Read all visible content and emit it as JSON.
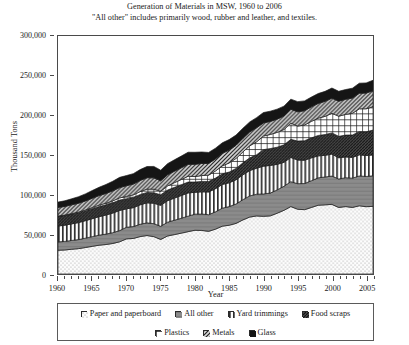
{
  "title": {
    "line1": "Generation of Materials in MSW, 1960 to 2006",
    "line2": "\"All other\" includes primarily wood, rubber and leather, and textiles."
  },
  "axes": {
    "ylabel": "Thousand Tons",
    "xlabel": "Year",
    "yticks": [
      "0",
      "50,000",
      "100,000",
      "150,000",
      "200,000",
      "250,000",
      "300,000"
    ],
    "xticks": [
      "1960",
      "1965",
      "1970",
      "1975",
      "1980",
      "1985",
      "1990",
      "1995",
      "2000",
      "2005"
    ]
  },
  "legend": {
    "row1": [
      {
        "label": "Paper and paperboard",
        "swatch": "dots-light"
      },
      {
        "label": "All other",
        "swatch": "gray-solid"
      },
      {
        "label": "Yard trimmings",
        "swatch": "vertical-stripes"
      },
      {
        "label": "Food scraps",
        "swatch": "dark-diagonal"
      }
    ],
    "row2": [
      {
        "label": "Plastics",
        "swatch": "crosshatch"
      },
      {
        "label": "Metals",
        "swatch": "diagonal"
      },
      {
        "label": "Glass",
        "swatch": "black-solid"
      }
    ]
  },
  "chart_data": {
    "type": "area",
    "title": "Generation of Materials in MSW, 1960 to 2006",
    "subtitle": "\"All other\" includes primarily wood, rubber and leather, and textiles.",
    "xlabel": "Year",
    "ylabel": "Thousand Tons",
    "xlim": [
      1960,
      2006
    ],
    "ylim": [
      0,
      300000
    ],
    "grid": false,
    "stacked": true,
    "legend_position": "bottom",
    "x": [
      1960,
      1961,
      1962,
      1963,
      1964,
      1965,
      1966,
      1967,
      1968,
      1969,
      1970,
      1971,
      1972,
      1973,
      1974,
      1975,
      1976,
      1977,
      1978,
      1979,
      1980,
      1981,
      1982,
      1983,
      1984,
      1985,
      1986,
      1987,
      1988,
      1989,
      1990,
      1991,
      1992,
      1993,
      1994,
      1995,
      1996,
      1997,
      1998,
      1999,
      2000,
      2001,
      2002,
      2003,
      2004,
      2005,
      2006
    ],
    "series": [
      {
        "name": "Paper and paperboard",
        "swatch": "dots-light",
        "values": [
          29990,
          30300,
          31200,
          32000,
          33400,
          34900,
          36300,
          37200,
          38500,
          40600,
          44310,
          44800,
          47200,
          48500,
          47100,
          43560,
          47900,
          49700,
          51500,
          53400,
          55160,
          54900,
          53800,
          56600,
          60300,
          61500,
          63800,
          68200,
          71800,
          73200,
          72730,
          73300,
          76600,
          80300,
          85000,
          81670,
          81100,
          83900,
          86700,
          87200,
          87740,
          83900,
          85000,
          83900,
          86000,
          84840,
          85300
        ],
        "units": "thousand tons"
      },
      {
        "name": "All other",
        "swatch": "gray-solid",
        "values": [
          10510,
          10800,
          11100,
          11400,
          11800,
          12200,
          12700,
          13100,
          13600,
          14100,
          14630,
          15000,
          15500,
          16000,
          16300,
          16600,
          17400,
          18100,
          18800,
          19500,
          20300,
          20700,
          21000,
          21800,
          22700,
          23500,
          24400,
          25500,
          26600,
          27400,
          28190,
          28700,
          29400,
          30300,
          31400,
          32200,
          32900,
          33700,
          34500,
          35100,
          35700,
          35900,
          36400,
          36900,
          37600,
          38100,
          38500
        ],
        "units": "thousand tons"
      },
      {
        "name": "Yard trimmings",
        "swatch": "vertical-stripes",
        "values": [
          20000,
          20400,
          20900,
          21400,
          22000,
          22600,
          23300,
          24000,
          24700,
          25400,
          23200,
          23800,
          24500,
          25200,
          25800,
          26400,
          27100,
          27900,
          28600,
          29300,
          27500,
          28000,
          28600,
          29200,
          29900,
          30000,
          30600,
          31300,
          32000,
          32700,
          35000,
          34900,
          32200,
          30200,
          30500,
          29800,
          29400,
          28800,
          27700,
          27300,
          27700,
          26700,
          26200,
          26200,
          26600,
          26400,
          26300
        ],
        "units": "thousand tons"
      },
      {
        "name": "Food scraps",
        "swatch": "dark-diagonal",
        "values": [
          12200,
          12300,
          12400,
          12500,
          12600,
          12700,
          12800,
          12900,
          13000,
          13100,
          12800,
          12900,
          13000,
          13100,
          13200,
          13300,
          13400,
          13500,
          13600,
          13700,
          13000,
          13100,
          13200,
          13300,
          13400,
          13500,
          14300,
          15100,
          16000,
          17000,
          20800,
          21200,
          21600,
          22000,
          22800,
          23900,
          24600,
          25200,
          25700,
          26200,
          26700,
          27000,
          27500,
          28300,
          29200,
          29900,
          31300
        ],
        "units": "thousand tons"
      },
      {
        "name": "Plastics",
        "swatch": "crosshatch",
        "values": [
          390,
          480,
          590,
          720,
          880,
          1400,
          1700,
          2000,
          2400,
          2700,
          2900,
          3200,
          3700,
          4200,
          4500,
          4500,
          5200,
          5900,
          6600,
          7300,
          6830,
          7400,
          8000,
          9000,
          10000,
          11500,
          12600,
          13800,
          15200,
          16300,
          17130,
          17800,
          18700,
          19300,
          20400,
          18940,
          19800,
          20800,
          21800,
          22900,
          24700,
          25400,
          26100,
          27300,
          28800,
          29000,
          29500
        ],
        "units": "thousand tons"
      },
      {
        "name": "Metals",
        "swatch": "diagonal",
        "values": [
          10820,
          10900,
          11000,
          11200,
          11400,
          11700,
          12000,
          12300,
          12600,
          13000,
          13490,
          13600,
          14000,
          14400,
          14300,
          13100,
          14100,
          14400,
          14700,
          15000,
          15510,
          15200,
          14800,
          15200,
          15800,
          16200,
          16500,
          17000,
          17500,
          17800,
          16550,
          16400,
          16700,
          17000,
          17500,
          17900,
          18000,
          18300,
          18600,
          18900,
          19100,
          18900,
          19000,
          19200,
          19600,
          19800,
          20100
        ],
        "units": "thousand tons"
      },
      {
        "name": "Glass",
        "swatch": "black-solid",
        "values": [
          6720,
          7100,
          7600,
          8200,
          8900,
          9700,
          10500,
          11300,
          12100,
          12900,
          12740,
          13200,
          13700,
          14100,
          14400,
          13400,
          14000,
          14400,
          14800,
          15300,
          15130,
          14500,
          13800,
          13500,
          13300,
          13200,
          12900,
          12800,
          12600,
          12700,
          13100,
          12900,
          12600,
          12500,
          12800,
          12840,
          12400,
          12300,
          12500,
          12600,
          12770,
          12500,
          12300,
          12400,
          12700,
          12800,
          13200
        ],
        "units": "thousand tons"
      }
    ],
    "totals_note": "Stacked totals rise from about 88,000 thousand tons in 1960 to about 251,000 thousand tons in 2005.",
    "totals": [
      90630,
      92280,
      94790,
      97420,
      101000,
      105200,
      109300,
      112800,
      116900,
      121800,
      124070,
      126500,
      131600,
      135500,
      135600,
      130860,
      139100,
      149900,
      148600,
      153500,
      153430,
      153800,
      153200,
      162600,
      175400,
      169400,
      175100,
      183700,
      191700,
      197100,
      203500,
      205200,
      207800,
      211600,
      220400,
      217250,
      218200,
      223000,
      227500,
      230200,
      234410,
      230300,
      232500,
      234200,
      240500,
      240840,
      244200
    ]
  }
}
